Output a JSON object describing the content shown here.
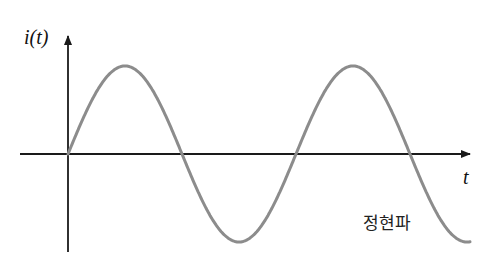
{
  "diagram": {
    "y_axis_label": "i(t)",
    "x_axis_label": "t",
    "caption": "정현파",
    "colors": {
      "axis": "#1a1a1a",
      "wave": "#8c8c8c",
      "background": "#ffffff"
    }
  },
  "chart_data": {
    "type": "line",
    "title": "정현파",
    "xlabel": "t",
    "ylabel": "i(t)",
    "origin_px": [
      68,
      154
    ],
    "amplitude_px": 88,
    "half_period_px": 114,
    "zero_crossings_px": [
      68,
      182,
      297,
      411
    ],
    "peaks_px": [
      [
        126,
        66
      ],
      [
        354,
        66
      ]
    ],
    "troughs_px": [
      [
        240,
        242
      ],
      [
        468,
        242
      ]
    ],
    "grid": false,
    "legend": false
  }
}
